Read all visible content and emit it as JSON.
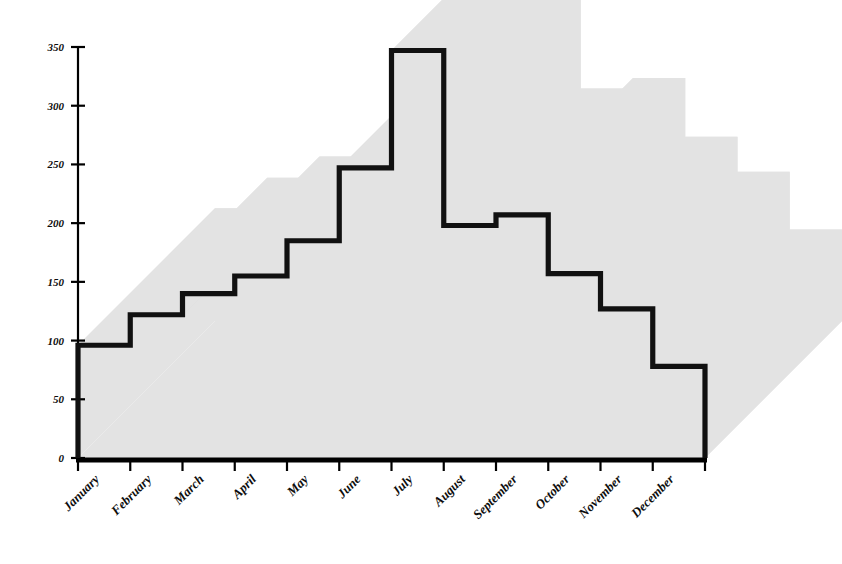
{
  "chart_data": {
    "type": "area",
    "subtype": "3d-step-area",
    "title": "",
    "subtitle": "",
    "xlabel": "",
    "ylabel": "",
    "categories": [
      "January",
      "February",
      "March",
      "April",
      "May",
      "June",
      "July",
      "August",
      "September",
      "October",
      "November",
      "December"
    ],
    "values": [
      96,
      122,
      140,
      155,
      185,
      247,
      347,
      198,
      207,
      157,
      127,
      78
    ],
    "series": [
      {
        "name": "",
        "values": [
          96,
          122,
          140,
          155,
          185,
          247,
          347,
          198,
          207,
          157,
          127,
          78
        ]
      }
    ],
    "ylim": [
      0,
      350
    ],
    "xlim": [
      0,
      12
    ],
    "yticks": [
      0,
      50,
      100,
      150,
      200,
      250,
      300,
      350
    ],
    "ytick_labels": [
      "0",
      "50",
      "100",
      "150",
      "200",
      "250",
      "300",
      "350"
    ],
    "xtick_labels": [
      "January",
      "February",
      "March",
      "April",
      "May",
      "June",
      "July",
      "August",
      "September",
      "October",
      "November",
      "December"
    ],
    "xtick_rotation_deg": 45,
    "grid": false,
    "legend": false,
    "legend_position": "none",
    "annotations": [],
    "colors": {
      "step_line": "#111111",
      "depth_fill": "#e3e3e3",
      "axis": "#000000",
      "background": "#ffffff",
      "text": "#0d0d0d"
    }
  },
  "axes": {
    "y_axis_name": "value-axis",
    "x_axis_name": "month-axis"
  }
}
